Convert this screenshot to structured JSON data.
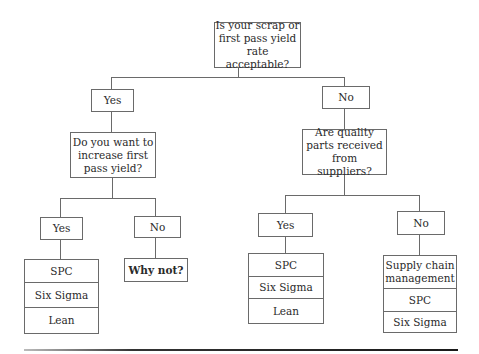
{
  "diagram": {
    "type": "decision-tree",
    "root": {
      "question": "Is your scrap or first pass yield rate acceptable?"
    },
    "level1": {
      "left_label": "Yes",
      "right_label": "No"
    },
    "level2": {
      "left_question": "Do you want to increase first pass yield?",
      "right_question": "Are quality parts received from suppliers?"
    },
    "level3": {
      "left_yes": "Yes",
      "left_no": "No",
      "right_yes": "Yes",
      "right_no": "No"
    },
    "outcomes": {
      "left_yes": [
        "SPC",
        "Six Sigma",
        "Lean"
      ],
      "left_no": "Why not?",
      "right_yes": [
        "SPC",
        "Six Sigma",
        "Lean"
      ],
      "right_no": [
        "Supply chain management",
        "SPC",
        "Six Sigma"
      ]
    }
  },
  "colors": {
    "border": "#6a6a6a",
    "text": "#2a2a2a",
    "background": "#ffffff"
  }
}
